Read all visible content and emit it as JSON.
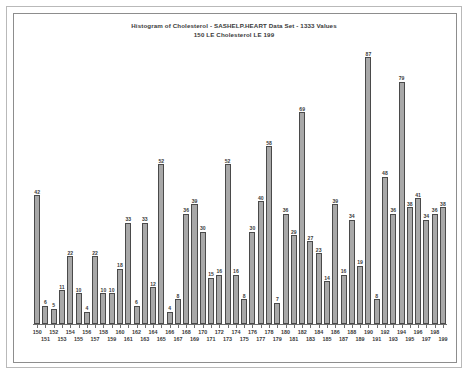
{
  "chart_data": {
    "type": "bar",
    "title": "Histogram of Cholesterol - SASHELP.HEART Data Set - 1333 Values",
    "subtitle": "150 LE Cholesterol LE 199",
    "xlabel": "",
    "ylabel": "",
    "grid": false,
    "legend": null,
    "ylim": [
      0,
      87
    ],
    "categories": [
      "150",
      "151",
      "152",
      "153",
      "154",
      "155",
      "156",
      "157",
      "158",
      "159",
      "160",
      "161",
      "162",
      "163",
      "164",
      "165",
      "166",
      "167",
      "168",
      "169",
      "170",
      "171",
      "172",
      "173",
      "174",
      "175",
      "176",
      "177",
      "178",
      "179",
      "180",
      "181",
      "182",
      "183",
      "184",
      "185",
      "186",
      "187",
      "188",
      "189",
      "190",
      "191",
      "192",
      "193",
      "194",
      "195",
      "196",
      "197",
      "198",
      "199"
    ],
    "values": [
      42,
      6,
      5,
      11,
      22,
      10,
      4,
      22,
      10,
      10,
      18,
      33,
      6,
      33,
      12,
      52,
      4,
      8,
      36,
      39,
      30,
      15,
      16,
      52,
      16,
      8,
      30,
      40,
      58,
      7,
      36,
      29,
      69,
      27,
      23,
      14,
      39,
      16,
      34,
      19,
      87,
      8,
      48,
      36,
      79,
      38,
      41,
      34,
      36,
      38
    ],
    "bar_color": "#a8a8a8",
    "bar_border_color": "#4a4a4a",
    "text_color": "#3a3a3a",
    "axis_color": "#6f6f6f",
    "frame_color": "#8d8d8d",
    "outer_frame_color": "#b9b9b9",
    "background": "#ffffff"
  },
  "xaxis_rows": [
    "top",
    "bottom",
    "top",
    "bottom",
    "top",
    "bottom",
    "top",
    "bottom",
    "top",
    "bottom",
    "top",
    "bottom",
    "top",
    "bottom",
    "top",
    "bottom",
    "top",
    "bottom",
    "top",
    "bottom",
    "top",
    "bottom",
    "top",
    "bottom",
    "top",
    "bottom",
    "top",
    "bottom",
    "top",
    "bottom",
    "top",
    "bottom",
    "top",
    "bottom",
    "top",
    "bottom",
    "top",
    "bottom",
    "top",
    "bottom",
    "top",
    "bottom",
    "top",
    "bottom",
    "top",
    "bottom",
    "top",
    "bottom",
    "top",
    "bottom"
  ]
}
